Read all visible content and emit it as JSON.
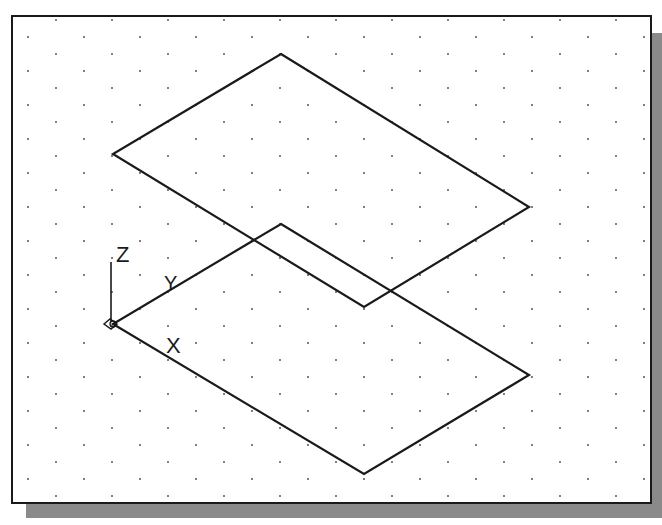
{
  "figure": {
    "colors": {
      "line": "#1a1a1a",
      "grid_dot": "#555555",
      "shadow": "#8a8a8a",
      "background": "#ffffff"
    }
  },
  "ucs_icon": {
    "axis_x_label": "X",
    "axis_y_label": "Y",
    "axis_z_label": "Z"
  },
  "shapes": {
    "upper_rhombus": {
      "top": [
        281,
        54
      ],
      "right": [
        529,
        207
      ],
      "bottom": [
        364,
        307
      ],
      "left": [
        113,
        154
      ]
    },
    "lower_rhombus": {
      "top": [
        281,
        224
      ],
      "right": [
        529,
        375
      ],
      "bottom": [
        364,
        474
      ],
      "left": [
        113,
        324
      ]
    }
  },
  "grid": {
    "type": "isometric-dots",
    "spacing_x": 56,
    "spacing_y": 34
  }
}
